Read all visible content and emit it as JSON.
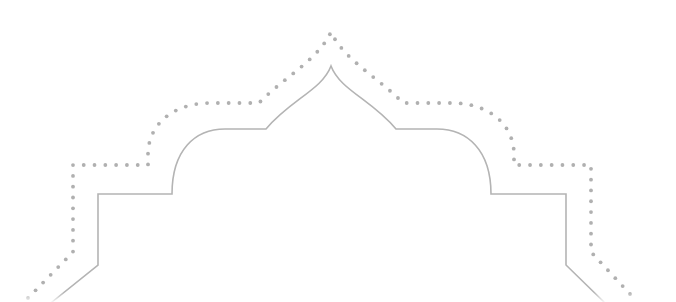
{
  "canvas": {
    "width": 676,
    "height": 302,
    "background": "#ffffff"
  },
  "ornament": {
    "name": "onion-dome-arch-frame",
    "inner_outline": {
      "style": "solid",
      "stroke": "#b4b4b4",
      "stroke_width": 1.6,
      "path": "M 52 302 L 98 265 L 98 194 L 172 194 C 172 150 195 129 225 129 L 266 129 C 290 100 322 90 331 66 C 340 90 372 100 396 129 L 437 129 C 467 129 491 150 491 194 L 566 194 L 566 265 L 604 302"
    },
    "outer_outline": {
      "style": "dotted",
      "stroke": "#b0b0b0",
      "dot_radius": 1.9,
      "dot_spacing": 10.8,
      "path": "M 28 298 L 73 252 L 73 165 L 148 165 L 148 152 C 150 120 178 103 210 103 L 259 103 C 283 78 318 60 331 32 C 344 60 379 78 403 103 L 452 103 C 484 103 512 120 514 152 L 514 165 L 591 165 L 591 252 L 630 294"
    }
  }
}
